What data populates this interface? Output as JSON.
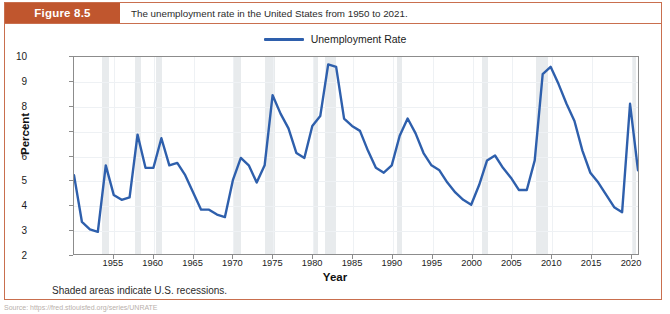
{
  "figure": {
    "tag": "Figure 8.5",
    "caption": "The unemployment rate in the United States from 1950 to 2021.",
    "note": "Shaded areas indicate U.S. recessions.",
    "frame_color": "#c96f4e",
    "tag_color": "#c0562e"
  },
  "legend": {
    "entries": [
      {
        "label": "Unemployment Rate",
        "color": "#2e5fac"
      }
    ],
    "position": "top-center"
  },
  "chart_data": {
    "type": "line",
    "title": "The unemployment rate in the United States from 1950 to 2021.",
    "xlabel": "Year",
    "ylabel": "Percent",
    "xlim": [
      1950,
      2021
    ],
    "ylim": [
      2,
      10
    ],
    "grid": true,
    "yticks": [
      2,
      3,
      4,
      5,
      6,
      7,
      8,
      9,
      10
    ],
    "xticks": [
      1955,
      1960,
      1965,
      1970,
      1975,
      1980,
      1985,
      1990,
      1995,
      2000,
      2005,
      2010,
      2015,
      2020
    ],
    "series": [
      {
        "name": "Unemployment Rate",
        "color": "#2e5fac",
        "x": [
          1950,
          1951,
          1952,
          1953,
          1954,
          1955,
          1956,
          1957,
          1958,
          1959,
          1960,
          1961,
          1962,
          1963,
          1964,
          1965,
          1966,
          1967,
          1968,
          1969,
          1970,
          1971,
          1972,
          1973,
          1974,
          1975,
          1976,
          1977,
          1978,
          1979,
          1980,
          1981,
          1982,
          1983,
          1984,
          1985,
          1986,
          1987,
          1988,
          1989,
          1990,
          1991,
          1992,
          1993,
          1994,
          1995,
          1996,
          1997,
          1998,
          1999,
          2000,
          2001,
          2002,
          2003,
          2004,
          2005,
          2006,
          2007,
          2008,
          2009,
          2010,
          2011,
          2012,
          2013,
          2014,
          2015,
          2016,
          2017,
          2018,
          2019,
          2020,
          2021
        ],
        "values": [
          5.2,
          3.3,
          3.0,
          2.9,
          5.6,
          4.4,
          4.2,
          4.3,
          6.85,
          5.5,
          5.5,
          6.7,
          5.6,
          5.7,
          5.2,
          4.5,
          3.8,
          3.8,
          3.6,
          3.5,
          5.0,
          5.9,
          5.6,
          4.9,
          5.6,
          8.45,
          7.7,
          7.1,
          6.1,
          5.9,
          7.2,
          7.6,
          9.7,
          9.6,
          7.5,
          7.2,
          7.0,
          6.2,
          5.5,
          5.3,
          5.6,
          6.8,
          7.5,
          6.9,
          6.1,
          5.6,
          5.4,
          4.9,
          4.5,
          4.2,
          4.0,
          4.8,
          5.8,
          6.0,
          5.5,
          5.1,
          4.6,
          4.6,
          5.8,
          9.3,
          9.6,
          8.9,
          8.1,
          7.4,
          6.2,
          5.3,
          4.9,
          4.4,
          3.9,
          3.7,
          8.1,
          5.4
        ]
      }
    ],
    "shaded_regions": {
      "label": "U.S. recessions",
      "color": "#e4e7ea",
      "spans": [
        [
          1953.5,
          1954.4
        ],
        [
          1957.6,
          1958.4
        ],
        [
          1960.3,
          1961.1
        ],
        [
          1969.9,
          1970.9
        ],
        [
          1973.9,
          1975.2
        ],
        [
          1980.0,
          1980.6
        ],
        [
          1981.5,
          1982.9
        ],
        [
          1990.5,
          1991.2
        ],
        [
          2001.2,
          2001.9
        ],
        [
          2007.9,
          2009.5
        ],
        [
          2020.1,
          2020.5
        ]
      ]
    }
  },
  "source": {
    "text": "Source: https://fred.stlouisfed.org/series/UNRATE"
  }
}
